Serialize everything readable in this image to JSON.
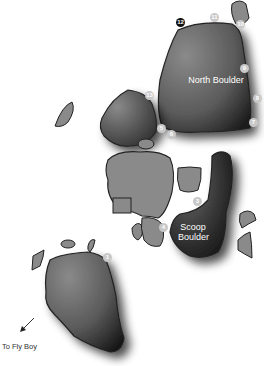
{
  "map": {
    "boulders": [
      {
        "name": "North Boulder"
      },
      {
        "name": "Scoop Boulder",
        "lines": [
          "Scoop",
          "Boulder"
        ]
      }
    ],
    "direction_note": "To Fly Boy",
    "markers": [
      {
        "num": "1",
        "x": 106,
        "y": 257,
        "style": "light"
      },
      {
        "num": "2",
        "x": 193,
        "y": 197,
        "style": "light"
      },
      {
        "num": "3",
        "x": 193,
        "y": 197,
        "style": "light"
      },
      {
        "num": "4",
        "x": 158,
        "y": 224,
        "style": "light"
      },
      {
        "num": "5",
        "x": 160,
        "y": 126,
        "style": "light"
      },
      {
        "num": "6",
        "x": 167,
        "y": 131,
        "style": "light"
      },
      {
        "num": "7",
        "x": 252,
        "y": 119,
        "style": "light"
      },
      {
        "num": "8",
        "x": 256,
        "y": 96,
        "style": "light"
      },
      {
        "num": "9",
        "x": 244,
        "y": 67,
        "style": "light"
      },
      {
        "num": "10",
        "x": 240,
        "y": 22,
        "style": "light"
      },
      {
        "num": "11",
        "x": 213,
        "y": 16,
        "style": "light"
      },
      {
        "num": "12",
        "x": 181,
        "y": 22,
        "style": "dark"
      },
      {
        "num": "13",
        "x": 149,
        "y": 93,
        "style": "light"
      }
    ]
  }
}
